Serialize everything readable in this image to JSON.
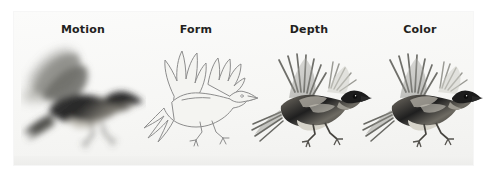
{
  "figure": {
    "background_color": "#ffffff",
    "panel_color": "#f7f7f5",
    "label_color": "#231f20",
    "panels": [
      {
        "label": "Motion",
        "key": "motion",
        "render_style": "motion-blurred greyscale photograph",
        "description": "Flying bird with heavily blurred, smeared wings conveying movement",
        "center_x": 83,
        "ink_color": "#3a3a3a",
        "blur_px": 3.4,
        "outline_only": false
      },
      {
        "label": "Form",
        "key": "form",
        "render_style": "pencil line-art outline",
        "description": "Flying bird reduced to a thin contour drawing with no interior shading",
        "center_x": 196,
        "ink_color": "#8d8d8d",
        "blur_px": 0,
        "outline_only": true
      },
      {
        "label": "Depth",
        "key": "depth",
        "render_style": "sharp greyscale photograph",
        "description": "Flying bird in crisp focus showing solid body and separated wing feathers",
        "center_x": 309,
        "ink_color": "#2e2e2e",
        "blur_px": 0,
        "outline_only": false
      },
      {
        "label": "Color",
        "key": "color",
        "render_style": "sharp greyscale photograph",
        "description": "Flying bird in crisp focus identical in pose to the Depth panel",
        "center_x": 420,
        "ink_color": "#2e2e2e",
        "blur_px": 0,
        "outline_only": false
      }
    ],
    "subject": {
      "animal": "bird",
      "pose": "in flight, wings raised, facing right",
      "count": 4
    }
  }
}
